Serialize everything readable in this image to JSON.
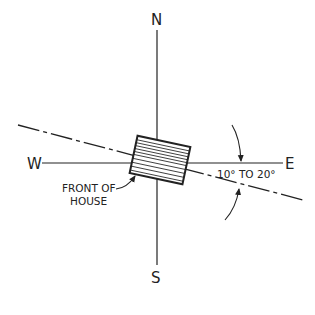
{
  "diagram": {
    "compass": {
      "north": "N",
      "south": "S",
      "east": "E",
      "west": "W"
    },
    "labels": {
      "front_of_house_line1": "FRONT OF",
      "front_of_house_line2": "HOUSE",
      "angle_range": "10° TO 20°"
    },
    "angle": {
      "min_degrees": 10,
      "max_degrees": 20
    },
    "colors": {
      "line": "#222222",
      "background": "#ffffff"
    }
  }
}
